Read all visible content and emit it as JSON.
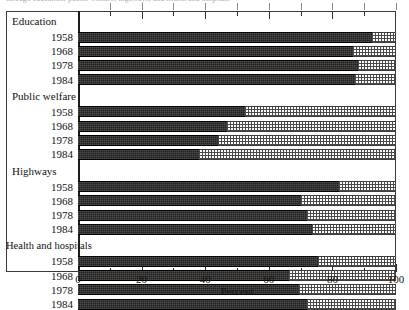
{
  "top_partial_caption": "through education; public welfare; highways; and health and hospitals",
  "chart_data": {
    "type": "bar",
    "orientation": "horizontal",
    "stacked": true,
    "title": "",
    "xlabel": "Percent",
    "ylabel": "",
    "xlim": [
      0,
      100
    ],
    "xticks": [
      0,
      20,
      40,
      60,
      80,
      100
    ],
    "xtick_labels": [
      "0",
      "20",
      "40",
      "60",
      "80",
      "100"
    ],
    "minor_xticks": [
      10,
      30,
      50,
      70,
      90
    ],
    "grid": false,
    "legend_position": "none",
    "series": [
      {
        "name": "dark",
        "color": "#23211f"
      },
      {
        "name": "light",
        "color": "#ffffff"
      }
    ],
    "groups": [
      {
        "label": "Education",
        "categories": [
          "1958",
          "1968",
          "1978",
          "1984"
        ],
        "values": [
          92.5,
          86.5,
          88.0,
          87.0
        ]
      },
      {
        "label": "Public welfare",
        "categories": [
          "1958",
          "1968",
          "1978",
          "1984"
        ],
        "values": [
          52.5,
          47.0,
          44.0,
          38.0
        ]
      },
      {
        "label": "Highways",
        "categories": [
          "1958",
          "1968",
          "1978",
          "1984"
        ],
        "values": [
          82.0,
          70.0,
          72.0,
          73.5
        ]
      },
      {
        "label": "Health and hospitals",
        "categories": [
          "1958",
          "1968",
          "1978",
          "1984"
        ],
        "values": [
          75.5,
          66.5,
          69.5,
          72.0
        ]
      }
    ]
  }
}
